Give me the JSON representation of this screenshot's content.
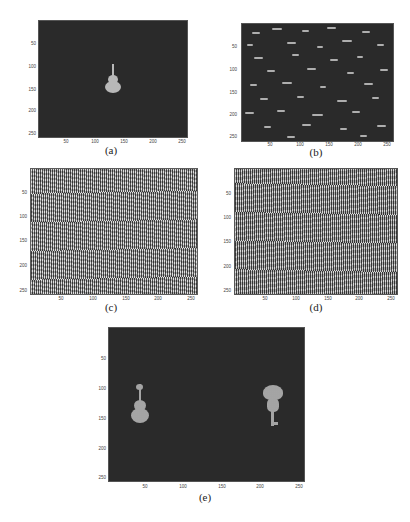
{
  "figure": {
    "panels": [
      {
        "id": "a",
        "caption": "(a)",
        "description": "dark background with a solid violin silhouette near center",
        "yticks": [
          "50",
          "100",
          "150",
          "200",
          "250"
        ],
        "xticks": [
          "50",
          "100",
          "150",
          "200",
          "250"
        ]
      },
      {
        "id": "b",
        "caption": "(b)",
        "description": "dark background with scattered short bright horizontal streaks",
        "yticks": [
          "50",
          "100",
          "150",
          "200",
          "250"
        ],
        "xticks": [
          "50",
          "100",
          "150",
          "200",
          "250"
        ]
      },
      {
        "id": "c",
        "caption": "(c)",
        "description": "dense fringe/noise pattern",
        "yticks": [
          "50",
          "100",
          "150",
          "200",
          "250"
        ],
        "xticks": [
          "50",
          "100",
          "150",
          "200",
          "250"
        ]
      },
      {
        "id": "d",
        "caption": "(d)",
        "description": "dense vertical fringe pattern",
        "yticks": [
          "50",
          "100",
          "150",
          "200",
          "250"
        ],
        "xticks": [
          "50",
          "100",
          "150",
          "200",
          "250"
        ]
      },
      {
        "id": "e",
        "caption": "(e)",
        "description": "dark background with speckled violin on left and speckled tree/key shape on right",
        "yticks": [
          "50",
          "100",
          "150",
          "200",
          "250"
        ],
        "xticks": [
          "50",
          "100",
          "150",
          "200",
          "250"
        ]
      }
    ],
    "colors": {
      "plot_background": "#2a2a2a",
      "object_gray": "#b8b8b8",
      "page_background": "#ffffff"
    }
  }
}
